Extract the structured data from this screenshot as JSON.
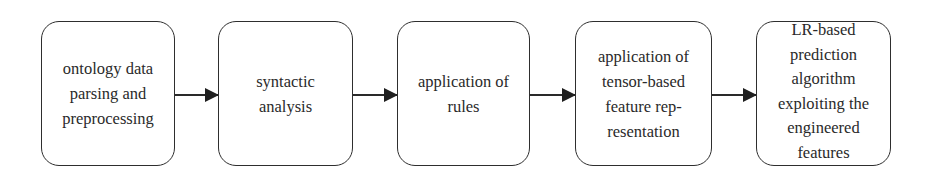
{
  "diagram": {
    "type": "flowchart",
    "direction": "left-to-right",
    "nodes": [
      {
        "id": "n1",
        "label": "ontology data\nparsing and\npreprocessing"
      },
      {
        "id": "n2",
        "label": "syntactic\nanalysis"
      },
      {
        "id": "n3",
        "label": "application of\nrules"
      },
      {
        "id": "n4",
        "label": "application of\ntensor-based\nfeature rep-\nresentation"
      },
      {
        "id": "n5",
        "label": "LR-based\nprediction\nalgorithm\nexploiting the\nengineered\nfeatures"
      }
    ],
    "edges": [
      {
        "from": "n1",
        "to": "n2"
      },
      {
        "from": "n2",
        "to": "n3"
      },
      {
        "from": "n3",
        "to": "n4"
      },
      {
        "from": "n4",
        "to": "n5"
      }
    ],
    "colors": {
      "stroke": "#2e2e2e",
      "text": "#2a2a2a",
      "background": "#ffffff"
    }
  }
}
